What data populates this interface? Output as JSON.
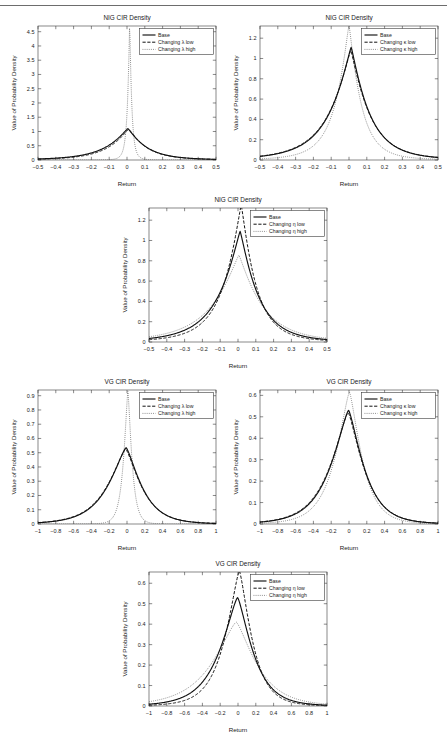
{
  "document": {
    "has_top_rule": true,
    "figure_count": 6
  },
  "common": {
    "xlabel": "Return",
    "ylabel": "Value of Probability Density",
    "legend_base": "Base",
    "colors": {
      "base": "#111111",
      "low": "#111111",
      "high": "#5d5d5d",
      "axis": "#3b3b3b",
      "rule": "#6d6d6d"
    }
  },
  "chart_data": [
    {
      "id": "nig-lambda",
      "type": "line",
      "title": "NIG CIR Density",
      "xlabel": "Return",
      "ylabel": "Value of Probability Density",
      "xlim": [
        -0.5,
        0.5
      ],
      "ylim": [
        0,
        4.7
      ],
      "xticks": [
        -0.5,
        -0.4,
        -0.3,
        -0.2,
        -0.1,
        0,
        0.1,
        0.2,
        0.3,
        0.4,
        0.5
      ],
      "xticklabels": [
        "-0.5",
        "-0.4",
        "-0.3",
        "-0.2",
        "-0.1",
        "0",
        "0.1",
        "0.2",
        "0.3",
        "0.4",
        "0.5"
      ],
      "yticks": [
        0,
        0.5,
        1,
        1.5,
        2,
        2.5,
        3,
        3.5,
        4,
        4.5
      ],
      "yticklabels": [
        "0",
        "0.5",
        "1",
        "1.5",
        "2",
        "2.5",
        "3",
        "3.5",
        "4",
        "4.5"
      ],
      "grid": false,
      "legend_position": "top-right",
      "series": [
        {
          "name": "Base",
          "style": "solid",
          "peak_x": 0.005,
          "peak_y": 1.1,
          "scale": 0.105,
          "shape": "nig",
          "skew": -0.35
        },
        {
          "name": "Changing λ low",
          "style": "dashed",
          "peak_x": 0.01,
          "peak_y": 1.08,
          "scale": 0.1,
          "shape": "nig",
          "skew": -0.3
        },
        {
          "name": "Changing λ high",
          "style": "dotted",
          "peak_x": 0.015,
          "peak_y": 4.62,
          "scale": 0.012,
          "shape": "nig",
          "skew": -0.1
        }
      ]
    },
    {
      "id": "nig-kappa",
      "type": "line",
      "title": "NIG CIR Density",
      "xlabel": "Return",
      "ylabel": "Value of Probability Density",
      "xlim": [
        -0.5,
        0.5
      ],
      "ylim": [
        0,
        1.32
      ],
      "xticks": [
        -0.5,
        -0.4,
        -0.3,
        -0.2,
        -0.1,
        0,
        0.1,
        0.2,
        0.3,
        0.4,
        0.5
      ],
      "xticklabels": [
        "-0.5",
        "-0.4",
        "-0.3",
        "-0.2",
        "-0.1",
        "0",
        "0.1",
        "0.2",
        "0.3",
        "0.4",
        "0.5"
      ],
      "yticks": [
        0,
        0.2,
        0.4,
        0.6,
        0.8,
        1,
        1.2
      ],
      "yticklabels": [
        "0",
        "0.2",
        "0.4",
        "0.6",
        "0.8",
        "1",
        "1.2"
      ],
      "grid": false,
      "legend_position": "top-right",
      "series": [
        {
          "name": "Base",
          "style": "solid",
          "peak_x": 0.012,
          "peak_y": 1.11,
          "scale": 0.105,
          "shape": "nig",
          "skew": -0.35
        },
        {
          "name": "Changing κ low",
          "style": "dashed",
          "peak_x": 0.01,
          "peak_y": 1.08,
          "scale": 0.108,
          "shape": "nig",
          "skew": -0.35
        },
        {
          "name": "Changing κ high",
          "style": "dotted",
          "peak_x": 0.0,
          "peak_y": 1.33,
          "scale": 0.07,
          "shape": "nig",
          "skew": -0.25
        }
      ]
    },
    {
      "id": "nig-eta",
      "type": "line",
      "title": "NIG CIR Density",
      "xlabel": "Return",
      "ylabel": "Value of Probability Density",
      "xlim": [
        -0.5,
        0.5
      ],
      "ylim": [
        0,
        1.32
      ],
      "xticks": [
        -0.5,
        -0.4,
        -0.3,
        -0.2,
        -0.1,
        0,
        0.1,
        0.2,
        0.3,
        0.4,
        0.5
      ],
      "xticklabels": [
        "-0.5",
        "-0.4",
        "-0.3",
        "-0.2",
        "-0.1",
        "0",
        "0.1",
        "0.2",
        "0.3",
        "0.4",
        "0.5"
      ],
      "yticks": [
        0,
        0.2,
        0.4,
        0.6,
        0.8,
        1,
        1.2
      ],
      "yticklabels": [
        "0",
        "0.2",
        "0.4",
        "0.6",
        "0.8",
        "1",
        "1.2"
      ],
      "grid": false,
      "legend_position": "top-right",
      "series": [
        {
          "name": "Base",
          "style": "solid",
          "peak_x": 0.012,
          "peak_y": 1.09,
          "scale": 0.105,
          "shape": "nig",
          "skew": -0.35
        },
        {
          "name": "Changing η low",
          "style": "dashed",
          "peak_x": 0.018,
          "peak_y": 1.34,
          "scale": 0.085,
          "shape": "nig",
          "skew": -0.35
        },
        {
          "name": "Changing η high",
          "style": "dotted",
          "peak_x": 0.005,
          "peak_y": 0.855,
          "scale": 0.135,
          "shape": "nig",
          "skew": -0.3
        }
      ]
    },
    {
      "id": "vg-lambda",
      "type": "line",
      "title": "VG CIR Density",
      "xlabel": "Return",
      "ylabel": "Value of Probability Density",
      "xlim": [
        -1,
        1
      ],
      "ylim": [
        0,
        0.94
      ],
      "xticks": [
        -1,
        -0.8,
        -0.6,
        -0.4,
        -0.2,
        0,
        0.2,
        0.4,
        0.6,
        0.8,
        1
      ],
      "xticklabels": [
        "-1",
        "-0.8",
        "-0.6",
        "-0.4",
        "-0.2",
        "0",
        "0.2",
        "0.4",
        "0.6",
        "0.8",
        "1"
      ],
      "yticks": [
        0,
        0.1,
        0.2,
        0.3,
        0.4,
        0.5,
        0.6,
        0.7,
        0.8,
        0.9
      ],
      "yticklabels": [
        "0",
        "0.1",
        "0.2",
        "0.3",
        "0.4",
        "0.5",
        "0.6",
        "0.7",
        "0.8",
        "0.9"
      ],
      "grid": false,
      "legend_position": "top-right",
      "series": [
        {
          "name": "Base",
          "style": "solid",
          "peak_x": -0.01,
          "peak_y": 0.535,
          "scale": 0.215,
          "shape": "vg",
          "skew": -0.35
        },
        {
          "name": "Changing λ low",
          "style": "dashed",
          "peak_x": -0.015,
          "peak_y": 0.525,
          "scale": 0.22,
          "shape": "vg",
          "skew": -0.35
        },
        {
          "name": "Changing λ high",
          "style": "dotted",
          "peak_x": 0.01,
          "peak_y": 0.93,
          "scale": 0.055,
          "shape": "vg",
          "skew": -0.15
        }
      ]
    },
    {
      "id": "vg-kappa",
      "type": "line",
      "title": "VG CIR Density",
      "xlabel": "Return",
      "ylabel": "Value of Probability Density",
      "xlim": [
        -1,
        1
      ],
      "ylim": [
        0,
        0.625
      ],
      "xticks": [
        -1,
        -0.8,
        -0.6,
        -0.4,
        -0.2,
        0,
        0.2,
        0.4,
        0.6,
        0.8,
        1
      ],
      "xticklabels": [
        "-1",
        "-0.8",
        "-0.6",
        "-0.4",
        "-0.2",
        "0",
        "0.2",
        "0.4",
        "0.6",
        "0.8",
        "1"
      ],
      "yticks": [
        0,
        0.1,
        0.2,
        0.3,
        0.4,
        0.5,
        0.6
      ],
      "yticklabels": [
        "0",
        "0.1",
        "0.2",
        "0.3",
        "0.4",
        "0.5",
        "0.6"
      ],
      "grid": false,
      "legend_position": "top-right",
      "series": [
        {
          "name": "Base",
          "style": "solid",
          "peak_x": -0.005,
          "peak_y": 0.53,
          "scale": 0.215,
          "shape": "vg",
          "skew": -0.35
        },
        {
          "name": "Changing κ low",
          "style": "dashed",
          "peak_x": -0.01,
          "peak_y": 0.52,
          "scale": 0.22,
          "shape": "vg",
          "skew": -0.35
        },
        {
          "name": "Changing κ high",
          "style": "dotted",
          "peak_x": 0.005,
          "peak_y": 0.615,
          "scale": 0.175,
          "shape": "vg",
          "skew": -0.3
        }
      ]
    },
    {
      "id": "vg-eta",
      "type": "line",
      "title": "VG CIR Density",
      "xlabel": "Return",
      "ylabel": "Value of Probability Density",
      "xlim": [
        -1,
        1
      ],
      "ylim": [
        0,
        0.655
      ],
      "xticks": [
        -1,
        -0.8,
        -0.6,
        -0.4,
        -0.2,
        0,
        0.2,
        0.4,
        0.6,
        0.8,
        1
      ],
      "xticklabels": [
        "-1",
        "-0.8",
        "-0.6",
        "-0.4",
        "-0.2",
        "0",
        "0.2",
        "0.4",
        "0.6",
        "0.8",
        "1"
      ],
      "yticks": [
        0,
        0.1,
        0.2,
        0.3,
        0.4,
        0.5,
        0.6
      ],
      "yticklabels": [
        "0",
        "0.1",
        "0.2",
        "0.3",
        "0.4",
        "0.5",
        "0.6"
      ],
      "grid": false,
      "legend_position": "top-right",
      "series": [
        {
          "name": "Base",
          "style": "solid",
          "peak_x": -0.005,
          "peak_y": 0.53,
          "scale": 0.215,
          "shape": "vg",
          "skew": -0.35
        },
        {
          "name": "Changing η low",
          "style": "dashed",
          "peak_x": 0.015,
          "peak_y": 0.66,
          "scale": 0.175,
          "shape": "vg",
          "skew": -0.3
        },
        {
          "name": "Changing η high",
          "style": "dotted",
          "peak_x": -0.02,
          "peak_y": 0.41,
          "scale": 0.285,
          "shape": "vg",
          "skew": -0.4
        }
      ]
    }
  ]
}
